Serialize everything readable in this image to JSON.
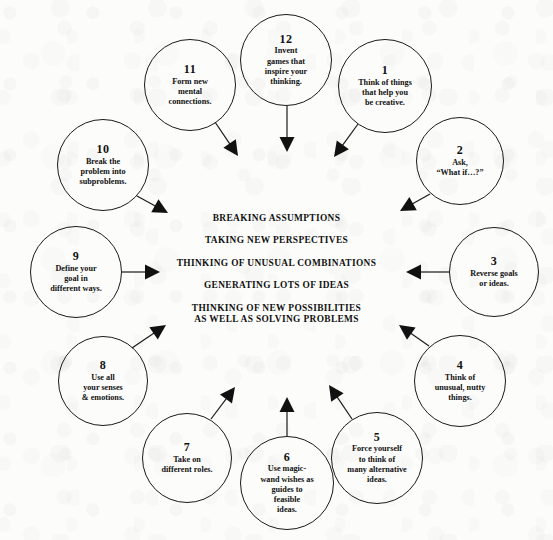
{
  "diagram": {
    "center_block": {
      "lines": [
        "BREAKING ASSUMPTIONS",
        "TAKING NEW PERSPECTIVES",
        "THINKING OF UNUSUAL COMBINATIONS",
        "GENERATING LOTS OF IDEAS",
        "THINKING OF NEW POSSIBILITIES\nAS WELL AS SOLVING PROBLEMS"
      ]
    },
    "colors": {
      "background": "#fcfcfb",
      "ink": "#111111",
      "stroke": "#1a1a1a",
      "arrow_fill": "#111111"
    },
    "nodes": [
      {
        "number": "1",
        "text": "Think of things\nthat help you\nbe creative.",
        "cx": 385,
        "cy": 86,
        "r": 47
      },
      {
        "number": "2",
        "text": "Ask,\n“What if…?”",
        "cx": 460,
        "cy": 161,
        "r": 44
      },
      {
        "number": "3",
        "text": "Reverse goals\nor ideas.",
        "cx": 494,
        "cy": 272,
        "r": 45
      },
      {
        "number": "4",
        "text": "Think of\nunusual, nutty\nthings.",
        "cx": 460,
        "cy": 381,
        "r": 46
      },
      {
        "number": "5",
        "text": "Force yourself\nto think of\nmany alternative\nideas.",
        "cx": 377,
        "cy": 458,
        "r": 46
      },
      {
        "number": "6",
        "text": "Use magic-\nwand wishes as\nguides to\nfeasible\nideas.",
        "cx": 287,
        "cy": 483,
        "r": 47
      },
      {
        "number": "7",
        "text": "Take on\ndifferent roles.",
        "cx": 187,
        "cy": 458,
        "r": 45
      },
      {
        "number": "8",
        "text": "Use all\nyour senses\n& emotions.",
        "cx": 103,
        "cy": 381,
        "r": 45
      },
      {
        "number": "9",
        "text": "Define your\ngoal in\ndifferent ways.",
        "cx": 76,
        "cy": 272,
        "r": 46
      },
      {
        "number": "10",
        "text": "Break the\nproblem into\nsubproblems.",
        "cx": 103,
        "cy": 165,
        "r": 46
      },
      {
        "number": "11",
        "text": "Form new\nmental\nconnections.",
        "cx": 190,
        "cy": 85,
        "r": 46
      },
      {
        "number": "12",
        "text": "Invent\ngames that\ninspire your\nthinking.",
        "cx": 286,
        "cy": 60,
        "r": 46
      }
    ],
    "arrows": [
      {
        "from": "1",
        "x1": 358,
        "y1": 124,
        "x2": 334,
        "y2": 157
      },
      {
        "from": "2",
        "x1": 430,
        "y1": 194,
        "x2": 400,
        "y2": 211
      },
      {
        "from": "3",
        "x1": 449,
        "y1": 272,
        "x2": 406,
        "y2": 272
      },
      {
        "from": "4",
        "x1": 429,
        "y1": 346,
        "x2": 399,
        "y2": 325
      },
      {
        "from": "5",
        "x1": 352,
        "y1": 419,
        "x2": 329,
        "y2": 385
      },
      {
        "from": "6",
        "x1": 287,
        "y1": 436,
        "x2": 287,
        "y2": 397
      },
      {
        "from": "7",
        "x1": 211,
        "y1": 419,
        "x2": 235,
        "y2": 387
      },
      {
        "from": "8",
        "x1": 132,
        "y1": 348,
        "x2": 166,
        "y2": 325
      },
      {
        "from": "9",
        "x1": 122,
        "y1": 272,
        "x2": 160,
        "y2": 272
      },
      {
        "from": "10",
        "x1": 137,
        "y1": 196,
        "x2": 168,
        "y2": 213
      },
      {
        "from": "11",
        "x1": 215,
        "y1": 122,
        "x2": 238,
        "y2": 156
      },
      {
        "from": "12",
        "x1": 287,
        "y1": 106,
        "x2": 287,
        "y2": 152
      }
    ]
  }
}
